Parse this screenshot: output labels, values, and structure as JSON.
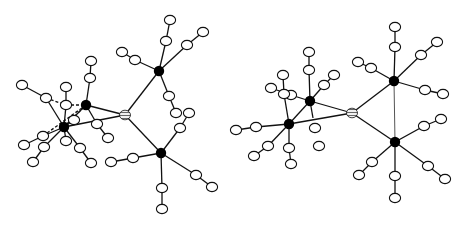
{
  "figure": {
    "colors": {
      "background": "#ffffff",
      "bond": "#111111",
      "heavy_atom": "#000000",
      "light_atom": "#ffffff",
      "central_atom_hatch": "#888888"
    }
  },
  "molecules": [
    {
      "id": "left",
      "center": [
        125,
        115
      ],
      "metals": [
        [
          159,
          71
        ],
        [
          161,
          153
        ],
        [
          86,
          105
        ],
        [
          64,
          127
        ]
      ],
      "bonds": [
        [
          [
            125,
            115
          ],
          [
            159,
            71
          ]
        ],
        [
          [
            125,
            115
          ],
          [
            161,
            153
          ]
        ],
        [
          [
            125,
            115
          ],
          [
            86,
            105
          ]
        ],
        [
          [
            125,
            115
          ],
          [
            64,
            127
          ]
        ],
        [
          [
            86,
            105
          ],
          [
            64,
            127
          ]
        ],
        [
          [
            86,
            105
          ],
          [
            90,
            78
          ]
        ],
        [
          [
            90,
            78
          ],
          [
            91,
            61
          ]
        ],
        [
          [
            86,
            105
          ],
          [
            97,
            124
          ]
        ],
        [
          [
            97,
            124
          ],
          [
            108,
            138
          ]
        ],
        [
          [
            64,
            127
          ],
          [
            46,
            98
          ]
        ],
        [
          [
            46,
            98
          ],
          [
            22,
            85
          ]
        ],
        [
          [
            64,
            127
          ],
          [
            66,
            105
          ]
        ],
        [
          [
            66,
            105
          ],
          [
            66,
            87
          ]
        ],
        [
          [
            64,
            127
          ],
          [
            43,
            136
          ]
        ],
        [
          [
            43,
            136
          ],
          [
            24,
            145
          ]
        ],
        [
          [
            64,
            127
          ],
          [
            44,
            147
          ]
        ],
        [
          [
            44,
            147
          ],
          [
            33,
            162
          ]
        ],
        [
          [
            64,
            127
          ],
          [
            66,
            141
          ]
        ],
        [
          [
            64,
            127
          ],
          [
            80,
            148
          ]
        ],
        [
          [
            80,
            148
          ],
          [
            91,
            163
          ]
        ],
        [
          [
            64,
            127
          ],
          [
            74,
            120
          ]
        ],
        [
          [
            159,
            71
          ],
          [
            135,
            60
          ]
        ],
        [
          [
            135,
            60
          ],
          [
            122,
            52
          ]
        ],
        [
          [
            159,
            71
          ],
          [
            166,
            41
          ]
        ],
        [
          [
            166,
            41
          ],
          [
            170,
            20
          ]
        ],
        [
          [
            159,
            71
          ],
          [
            187,
            45
          ]
        ],
        [
          [
            187,
            45
          ],
          [
            203,
            32
          ]
        ],
        [
          [
            159,
            71
          ],
          [
            169,
            96
          ]
        ],
        [
          [
            169,
            96
          ],
          [
            176,
            113
          ]
        ],
        [
          [
            161,
            153
          ],
          [
            180,
            128
          ]
        ],
        [
          [
            180,
            128
          ],
          [
            189,
            113
          ]
        ],
        [
          [
            161,
            153
          ],
          [
            133,
            158
          ]
        ],
        [
          [
            133,
            158
          ],
          [
            111,
            162
          ]
        ],
        [
          [
            161,
            153
          ],
          [
            162,
            188
          ]
        ],
        [
          [
            162,
            188
          ],
          [
            162,
            209
          ]
        ],
        [
          [
            161,
            153
          ],
          [
            196,
            175
          ]
        ],
        [
          [
            196,
            175
          ],
          [
            212,
            187
          ]
        ]
      ],
      "dashed_bonds": [
        [
          [
            46,
            98
          ],
          [
            66,
            105
          ]
        ],
        [
          [
            66,
            105
          ],
          [
            86,
            105
          ]
        ],
        [
          [
            43,
            136
          ],
          [
            86,
            105
          ]
        ],
        [
          [
            64,
            127
          ],
          [
            86,
            105
          ]
        ]
      ],
      "open_atoms": [
        [
          90,
          78
        ],
        [
          91,
          61
        ],
        [
          97,
          124
        ],
        [
          108,
          138
        ],
        [
          46,
          98
        ],
        [
          22,
          85
        ],
        [
          66,
          105
        ],
        [
          66,
          87
        ],
        [
          43,
          136
        ],
        [
          24,
          145
        ],
        [
          44,
          147
        ],
        [
          33,
          162
        ],
        [
          66,
          141
        ],
        [
          80,
          148
        ],
        [
          91,
          163
        ],
        [
          74,
          120
        ],
        [
          135,
          60
        ],
        [
          122,
          52
        ],
        [
          166,
          41
        ],
        [
          170,
          20
        ],
        [
          187,
          45
        ],
        [
          203,
          32
        ],
        [
          169,
          96
        ],
        [
          176,
          113
        ],
        [
          180,
          128
        ],
        [
          189,
          113
        ],
        [
          133,
          158
        ],
        [
          111,
          162
        ],
        [
          162,
          188
        ],
        [
          162,
          209
        ],
        [
          196,
          175
        ],
        [
          212,
          187
        ]
      ]
    },
    {
      "id": "right",
      "center": [
        352,
        113
      ],
      "metals": [
        [
          394,
          81
        ],
        [
          395,
          142
        ],
        [
          310,
          101
        ],
        [
          289,
          124
        ]
      ],
      "bonds": [
        [
          [
            352,
            113
          ],
          [
            394,
            81
          ]
        ],
        [
          [
            352,
            113
          ],
          [
            395,
            142
          ]
        ],
        [
          [
            352,
            113
          ],
          [
            310,
            101
          ]
        ],
        [
          [
            352,
            113
          ],
          [
            289,
            124
          ]
        ],
        [
          [
            310,
            101
          ],
          [
            289,
            124
          ]
        ],
        [
          [
            310,
            101
          ],
          [
            309,
            70
          ]
        ],
        [
          [
            309,
            70
          ],
          [
            309,
            52
          ]
        ],
        [
          [
            310,
            101
          ],
          [
            324,
            85
          ]
        ],
        [
          [
            324,
            85
          ],
          [
            334,
            75
          ]
        ],
        [
          [
            310,
            101
          ],
          [
            313,
            118
          ]
        ],
        [
          [
            310,
            101
          ],
          [
            291,
            95
          ]
        ],
        [
          [
            291,
            95
          ],
          [
            271,
            88
          ]
        ],
        [
          [
            289,
            124
          ],
          [
            284,
            94
          ]
        ],
        [
          [
            284,
            94
          ],
          [
            283,
            75
          ]
        ],
        [
          [
            289,
            124
          ],
          [
            256,
            127
          ]
        ],
        [
          [
            256,
            127
          ],
          [
            236,
            130
          ]
        ],
        [
          [
            289,
            124
          ],
          [
            268,
            146
          ]
        ],
        [
          [
            268,
            146
          ],
          [
            254,
            156
          ]
        ],
        [
          [
            289,
            124
          ],
          [
            289,
            148
          ]
        ],
        [
          [
            289,
            148
          ],
          [
            291,
            164
          ]
        ],
        [
          [
            394,
            81
          ],
          [
            371,
            68
          ]
        ],
        [
          [
            371,
            68
          ],
          [
            358,
            62
          ]
        ],
        [
          [
            394,
            81
          ],
          [
            395,
            47
          ]
        ],
        [
          [
            395,
            47
          ],
          [
            395,
            27
          ]
        ],
        [
          [
            394,
            81
          ],
          [
            421,
            55
          ]
        ],
        [
          [
            421,
            55
          ],
          [
            437,
            42
          ]
        ],
        [
          [
            394,
            81
          ],
          [
            425,
            90
          ]
        ],
        [
          [
            425,
            90
          ],
          [
            443,
            94
          ]
        ],
        [
          [
            395,
            142
          ],
          [
            424,
            126
          ]
        ],
        [
          [
            424,
            126
          ],
          [
            441,
            119
          ]
        ],
        [
          [
            395,
            142
          ],
          [
            372,
            162
          ]
        ],
        [
          [
            372,
            162
          ],
          [
            359,
            175
          ]
        ],
        [
          [
            395,
            142
          ],
          [
            395,
            176
          ]
        ],
        [
          [
            395,
            176
          ],
          [
            395,
            198
          ]
        ],
        [
          [
            395,
            142
          ],
          [
            428,
            166
          ]
        ],
        [
          [
            428,
            166
          ],
          [
            445,
            179
          ]
        ]
      ],
      "light_bonds": [
        [
          [
            394,
            81
          ],
          [
            395,
            142
          ]
        ]
      ],
      "open_atoms": [
        [
          309,
          70
        ],
        [
          309,
          52
        ],
        [
          324,
          85
        ],
        [
          334,
          75
        ],
        [
          291,
          95
        ],
        [
          271,
          88
        ],
        [
          284,
          94
        ],
        [
          283,
          75
        ],
        [
          256,
          127
        ],
        [
          236,
          130
        ],
        [
          268,
          146
        ],
        [
          254,
          156
        ],
        [
          289,
          148
        ],
        [
          291,
          164
        ],
        [
          315,
          128
        ],
        [
          319,
          146
        ],
        [
          371,
          68
        ],
        [
          358,
          62
        ],
        [
          395,
          47
        ],
        [
          395,
          27
        ],
        [
          421,
          55
        ],
        [
          437,
          42
        ],
        [
          425,
          90
        ],
        [
          443,
          94
        ],
        [
          424,
          126
        ],
        [
          441,
          119
        ],
        [
          372,
          162
        ],
        [
          359,
          175
        ],
        [
          395,
          176
        ],
        [
          395,
          198
        ],
        [
          428,
          166
        ],
        [
          445,
          179
        ]
      ]
    }
  ]
}
